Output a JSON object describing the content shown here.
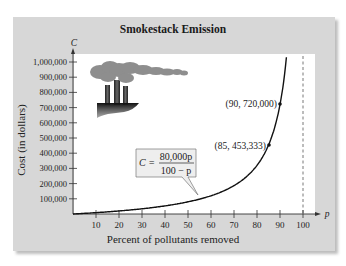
{
  "chart_data": {
    "type": "line",
    "title": "Smokestack Emission",
    "xlabel": "Percent of pollutants removed",
    "ylabel": "Cost (in dollars)",
    "x_axis_var": "p",
    "y_axis_var": "C",
    "xlim": [
      0,
      100
    ],
    "ylim": [
      0,
      1000000
    ],
    "x_ticks": [
      10,
      20,
      30,
      40,
      50,
      60,
      70,
      80,
      90,
      100
    ],
    "x_tick_labels": [
      "10",
      "20",
      "30",
      "40",
      "50",
      "60",
      "70",
      "80",
      "90",
      "100"
    ],
    "y_ticks": [
      100000,
      200000,
      300000,
      400000,
      500000,
      600000,
      700000,
      800000,
      900000,
      1000000
    ],
    "y_tick_labels": [
      "100,000",
      "200,000",
      "300,000",
      "400,000",
      "500,000",
      "600,000",
      "700,000",
      "800,000",
      "900,000",
      "1,000,000"
    ],
    "grid": false,
    "series": [
      {
        "name": "C = 80,000p / (100 - p)",
        "x": [
          0,
          10,
          20,
          30,
          40,
          50,
          60,
          70,
          80,
          85,
          90,
          92.5
        ],
        "values": [
          0,
          8889,
          20000,
          34286,
          53333,
          80000,
          120000,
          186667,
          320000,
          453333,
          720000,
          986667
        ]
      }
    ],
    "highlighted_points": [
      {
        "x": 85,
        "y": 453333,
        "label": "(85, 453,333)"
      },
      {
        "x": 90,
        "y": 720000,
        "label": "(90, 720,000)"
      }
    ],
    "asymptote": {
      "x": 100,
      "style": "dashed"
    },
    "annotations": [
      {
        "text": "C = 80,000p / (100 - p)",
        "numerator": "80,000p",
        "denominator": "100 − p",
        "lhs": "C ="
      }
    ]
  },
  "labels": {
    "title": "Smokestack Emission",
    "xlabel": "Percent of pollutants removed",
    "ylabel": "Cost (in dollars)",
    "x_var": "p",
    "y_var": "C",
    "point_85": "(85, 453,333)",
    "point_90": "(90, 720,000)",
    "formula_lhs": "C =",
    "formula_num": "80,000p",
    "formula_den": "100 − p"
  },
  "colors": {
    "panel": "#d7d7d7",
    "plot_bg": "#ffffff",
    "curve": "#111111",
    "smoke": "#8a8a8a",
    "callout_bg": "#eeeeee"
  }
}
